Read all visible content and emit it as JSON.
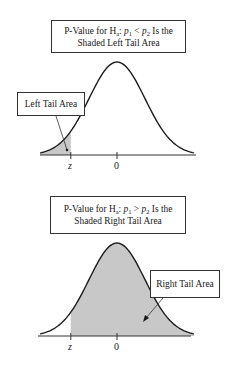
{
  "panels": [
    {
      "id": "left-tail",
      "title_line1_pre": "P-Value for H",
      "title_sub_a": "a",
      "title_colon": ": ",
      "title_p1": "p",
      "title_p1_sub": "1",
      "title_op": " < ",
      "title_p2": "p",
      "title_p2_sub": "2",
      "title_line1_post": " Is the",
      "title_line2": "Shaded Left Tail Area",
      "callout": "Left Tail Area",
      "shaded_region": "left",
      "tick_labels": [
        "z",
        "0"
      ],
      "z_value": -1.65
    },
    {
      "id": "right-tail",
      "title_line1_pre": "P-Value for H",
      "title_sub_a": "a",
      "title_colon": ": ",
      "title_p1": "p",
      "title_p1_sub": "1",
      "title_op": " > ",
      "title_p2": "p",
      "title_p2_sub": "2",
      "title_line1_post": " Is the",
      "title_line2": "Shaded Right Tail Area",
      "callout": "Right Tail Area",
      "shaded_region": "right",
      "tick_labels": [
        "z",
        "0"
      ],
      "z_value": -1.65
    }
  ],
  "colors": {
    "shade": "#c8c8c8",
    "curve": "#1a1a1a"
  }
}
